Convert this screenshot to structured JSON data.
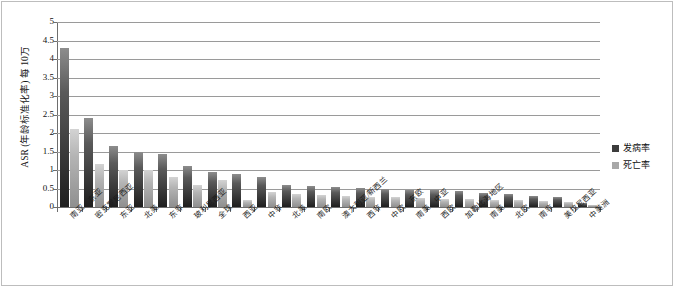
{
  "chart_data": {
    "type": "bar",
    "title": "",
    "xlabel": "",
    "ylabel": "ASR (年龄标准化率) 每 10万",
    "ylim": [
      0,
      5
    ],
    "yticks": [
      "0",
      "0.5",
      "1",
      "1.5",
      "2",
      "2.5",
      "3",
      "3.5",
      "4",
      "4.5",
      "5"
    ],
    "grid": true,
    "legend_position": "right",
    "categories": [
      "南亚、东亚",
      "密克罗尼西亚",
      "东亚",
      "北美",
      "东非",
      "玻利尼西亚",
      "全球",
      "西亚",
      "中非",
      "北美",
      "南欧",
      "澳大利亚/新西兰",
      "西非",
      "中欧、东欧",
      "南美、中亚",
      "西欧",
      "加勒比海地区",
      "南美",
      "北欧",
      "南非",
      "美拉尼西亚",
      "中美洲"
    ],
    "series": [
      {
        "name": "发病率",
        "color": "#3c3c3c",
        "values": [
          4.3,
          2.4,
          1.65,
          1.5,
          1.42,
          1.12,
          0.95,
          0.88,
          0.82,
          0.6,
          0.58,
          0.55,
          0.52,
          0.5,
          0.47,
          0.45,
          0.42,
          0.38,
          0.35,
          0.3,
          0.28,
          0.12
        ]
      },
      {
        "name": "死亡率",
        "color": "#a8a8a8",
        "values": [
          2.1,
          1.15,
          1.0,
          1.0,
          0.82,
          0.6,
          0.72,
          0.18,
          0.4,
          0.35,
          0.33,
          0.3,
          0.28,
          0.27,
          0.25,
          0.23,
          0.22,
          0.2,
          0.18,
          0.15,
          0.14,
          0.06
        ]
      }
    ]
  },
  "legend": {
    "items": [
      {
        "label": "发病率"
      },
      {
        "label": "死亡率"
      }
    ]
  }
}
